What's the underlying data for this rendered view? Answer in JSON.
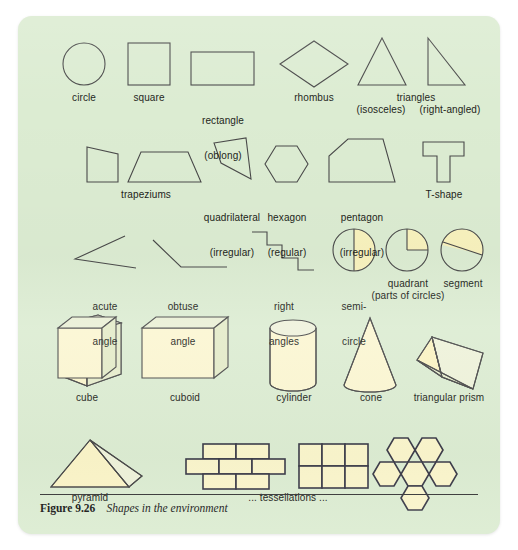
{
  "figure": {
    "number": "Figure 9.26",
    "title": "Shapes in the environment",
    "background_color": "#dcecd2",
    "stroke_color": "#4a4a4a",
    "fill_yellow": "#f9f3c4",
    "fill_yellow_light": "#fbf6d2"
  },
  "rows": [
    {
      "name": "plane-shapes-row-1",
      "items": [
        {
          "id": "circle",
          "label": [
            "circle"
          ]
        },
        {
          "id": "square",
          "label": [
            "square"
          ]
        },
        {
          "id": "rectangle",
          "label": [
            "rectangle",
            "(oblong)"
          ]
        },
        {
          "id": "rhombus",
          "label": [
            "rhombus"
          ]
        },
        {
          "id": "triangles",
          "label": [
            "triangles"
          ]
        },
        {
          "id": "isosceles",
          "label": [
            "(isosceles)"
          ]
        },
        {
          "id": "right-angled",
          "label": [
            "(right-angled)"
          ]
        }
      ]
    },
    {
      "name": "plane-shapes-row-2",
      "items": [
        {
          "id": "trapeziums",
          "label": [
            "trapeziums"
          ]
        },
        {
          "id": "quadrilateral",
          "label": [
            "quadrilateral",
            "(irregular)"
          ]
        },
        {
          "id": "hexagon",
          "label": [
            "hexagon",
            "(regular)"
          ]
        },
        {
          "id": "pentagon",
          "label": [
            "pentagon",
            "(irregular)"
          ]
        },
        {
          "id": "t-shape",
          "label": [
            "T-shape"
          ]
        }
      ]
    },
    {
      "name": "angles-and-circle-parts-row",
      "items": [
        {
          "id": "acute-angle",
          "label": [
            "acute",
            "angle"
          ]
        },
        {
          "id": "obtuse-angle",
          "label": [
            "obtuse",
            "angle"
          ]
        },
        {
          "id": "right-angles",
          "label": [
            "right",
            "angles"
          ]
        },
        {
          "id": "semi-circle",
          "label": [
            "semi-",
            "circle"
          ]
        },
        {
          "id": "quadrant",
          "label": [
            "quadrant"
          ]
        },
        {
          "id": "segment",
          "label": [
            "segment"
          ]
        },
        {
          "id": "parts-of-circles",
          "label": [
            "(parts of circles)"
          ]
        }
      ]
    },
    {
      "name": "solid-shapes-row",
      "items": [
        {
          "id": "cube",
          "label": [
            "cube"
          ]
        },
        {
          "id": "cuboid",
          "label": [
            "cuboid"
          ]
        },
        {
          "id": "cylinder",
          "label": [
            "cylinder"
          ]
        },
        {
          "id": "cone",
          "label": [
            "cone"
          ]
        },
        {
          "id": "triangular-prism",
          "label": [
            "triangular prism"
          ]
        }
      ]
    },
    {
      "name": "pyramid-and-tessellations-row",
      "items": [
        {
          "id": "pyramid",
          "label": [
            "pyramid"
          ]
        },
        {
          "id": "brick-tessellation",
          "label": []
        },
        {
          "id": "square-tessellation",
          "label": []
        },
        {
          "id": "hexagon-tessellation",
          "label": []
        },
        {
          "id": "tessellations-caption",
          "label": [
            "... tessellations ..."
          ]
        }
      ]
    }
  ],
  "labels": {
    "circle": "circle",
    "square": "square",
    "rectangle_line1": "rectangle",
    "rectangle_line2": "(oblong)",
    "rhombus": "rhombus",
    "triangles": "triangles",
    "isosceles": "(isosceles)",
    "right_angled": "(right-angled)",
    "trapeziums": "trapeziums",
    "quadrilateral_line1": "quadrilateral",
    "quadrilateral_line2": "(irregular)",
    "hexagon_line1": "hexagon",
    "hexagon_line2": "(regular)",
    "pentagon_line1": "pentagon",
    "pentagon_line2": "(irregular)",
    "t_shape": "T-shape",
    "acute_line1": "acute",
    "acute_line2": "angle",
    "obtuse_line1": "obtuse",
    "obtuse_line2": "angle",
    "right_line1": "right",
    "right_line2": "angles",
    "semi_line1": "semi-",
    "semi_line2": "circle",
    "quadrant": "quadrant",
    "segment": "segment",
    "parts_of_circles": "(parts of circles)",
    "cube": "cube",
    "cuboid": "cuboid",
    "cylinder": "cylinder",
    "cone": "cone",
    "triangular_prism": "triangular prism",
    "pyramid": "pyramid",
    "tessellations": "... tessellations ..."
  },
  "caption": {
    "number": "Figure 9.26",
    "title": "Shapes in the environment"
  }
}
